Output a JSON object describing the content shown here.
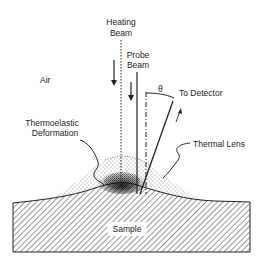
{
  "diagram": {
    "labels": {
      "heating_beam_line1": "Heating",
      "heating_beam_line2": "Beam",
      "probe_beam_line1": "Probe",
      "probe_beam_line2": "Beam",
      "air": "Air",
      "theta": "θ",
      "to_detector": "To Detector",
      "thermoelastic_line1": "Thermoelastic",
      "thermoelastic_line2": "Deformation",
      "thermal_lens": "Thermal Lens",
      "sample": "Sample"
    },
    "colors": {
      "ink": "#222222",
      "background": "#ffffff"
    }
  }
}
